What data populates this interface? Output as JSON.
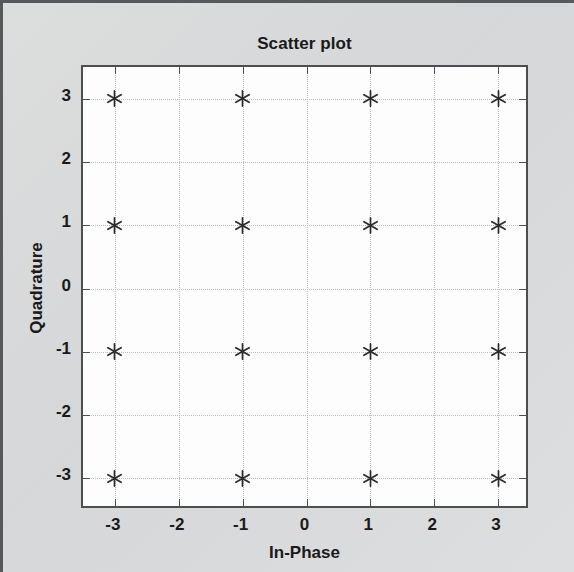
{
  "figure": {
    "title": "Scatter plot",
    "background_color": "#d9dadb",
    "plot_background_color": "#fdfdfd",
    "axis_color": "#4b4f52",
    "grid_color": "#b9bcc2",
    "marker_color": "#2b2b2b",
    "marker_symbol": "asterisk"
  },
  "chart_data": {
    "type": "scatter",
    "title": "Scatter plot",
    "xlabel": "In-Phase",
    "ylabel": "Quadrature",
    "xlim": [
      -3.5,
      3.5
    ],
    "ylim": [
      -3.5,
      3.5
    ],
    "xticks": [
      -3,
      -2,
      -1,
      0,
      1,
      2,
      3
    ],
    "yticks": [
      -3,
      -2,
      -1,
      0,
      1,
      2,
      3
    ],
    "xtick_labels": [
      "-3",
      "-2",
      "-1",
      "0",
      "1",
      "2",
      "3"
    ],
    "ytick_labels": [
      "-3",
      "-2",
      "-1",
      "0",
      "1",
      "2",
      "3"
    ],
    "grid": true,
    "grid_style": "dotted",
    "legend": null,
    "marker": "*",
    "series": [
      {
        "name": "16-QAM constellation",
        "points": [
          {
            "x": -3,
            "y": 3
          },
          {
            "x": -1,
            "y": 3
          },
          {
            "x": 1,
            "y": 3
          },
          {
            "x": 3,
            "y": 3
          },
          {
            "x": -3,
            "y": 1
          },
          {
            "x": -1,
            "y": 1
          },
          {
            "x": 1,
            "y": 1
          },
          {
            "x": 3,
            "y": 1
          },
          {
            "x": -3,
            "y": -1
          },
          {
            "x": -1,
            "y": -1
          },
          {
            "x": 1,
            "y": -1
          },
          {
            "x": 3,
            "y": -1
          },
          {
            "x": -3,
            "y": -3
          },
          {
            "x": -1,
            "y": -3
          },
          {
            "x": 1,
            "y": -3
          },
          {
            "x": 3,
            "y": -3
          }
        ]
      }
    ]
  }
}
